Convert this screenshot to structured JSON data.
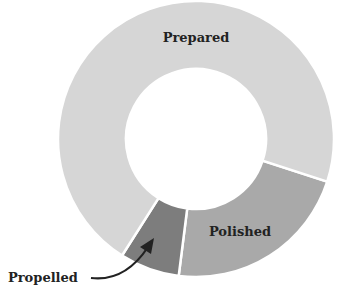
{
  "chart_data": {
    "type": "pie",
    "variant": "donut",
    "title": "",
    "categories": [
      "Prepared",
      "Polished",
      "Propelled"
    ],
    "values": [
      71,
      22,
      7
    ],
    "colors": [
      "#d6d6d6",
      "#a9a9a9",
      "#7d7d7d"
    ],
    "legend": "none",
    "annotations": [
      {
        "text": "Propelled",
        "type": "arrow-callout",
        "target": "Propelled"
      }
    ]
  },
  "labels": {
    "prepared": "Prepared",
    "polished": "Polished",
    "propelled": "Propelled"
  }
}
